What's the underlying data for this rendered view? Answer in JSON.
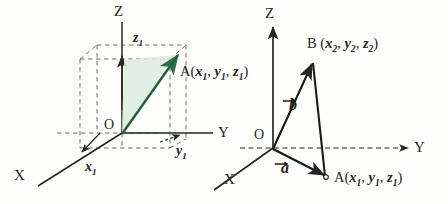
{
  "figure": {
    "type": "geometry-diagram",
    "background_color": "#fdfdfb",
    "ink_color": "#262626",
    "accent_color": "#4f8f63"
  },
  "left_diagram": {
    "name": "point-A-in-3d-box",
    "axes": {
      "z": "Z",
      "y": "Y",
      "x": "X"
    },
    "origin": "O",
    "projections": {
      "z_component": "z",
      "z_subscript": "1",
      "y_component": "y",
      "y_subscript": "1",
      "x_component": "x",
      "x_subscript": "1"
    },
    "point_label": {
      "name": "A",
      "open_paren": "(",
      "coords": [
        "x",
        "y",
        "z"
      ],
      "subscripts": [
        "1",
        "1",
        "1"
      ],
      "close_paren": ")",
      "full": "A(x1, y1, z1)"
    },
    "shaded_region_color": "#dcebdf",
    "vector_color": "#3f7a55"
  },
  "right_diagram": {
    "name": "vectors-a-and-b",
    "axes": {
      "z": "Z",
      "y": "Y",
      "x": "X"
    },
    "origin": "O",
    "vectors": [
      {
        "name": "vector-b",
        "label": "b",
        "target": "B"
      },
      {
        "name": "vector-a",
        "label": "a",
        "target": "A"
      }
    ],
    "point_B": {
      "name": "B",
      "open_paren": "(",
      "coords": [
        "x",
        "y",
        "z"
      ],
      "subscripts": [
        "2",
        "2",
        "2"
      ],
      "close_paren": ")",
      "full": "B(x2, y2, z2)"
    },
    "point_A": {
      "name": "A",
      "open_paren": "(",
      "coords": [
        "x",
        "y",
        "z"
      ],
      "subscripts": [
        "1",
        "1",
        "1"
      ],
      "close_paren": ")",
      "full": "A(x1, y1, z1)"
    }
  }
}
